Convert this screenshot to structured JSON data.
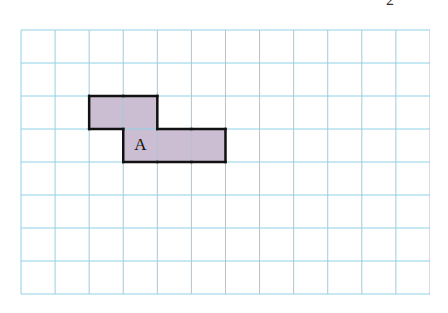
{
  "page": {
    "page_number_partial": "2"
  },
  "grid": {
    "columns": 12,
    "rows": 8,
    "cell_width": 34.08,
    "cell_height": 33,
    "line_color": "#8fd2e6",
    "background": "#ffffff"
  },
  "shape": {
    "label": "A",
    "fill_color": "#cbbdd2",
    "stroke_color": "#111111",
    "cells": [
      {
        "col": 2,
        "row": 2
      },
      {
        "col": 3,
        "row": 2
      },
      {
        "col": 3,
        "row": 3
      },
      {
        "col": 4,
        "row": 3
      },
      {
        "col": 5,
        "row": 3
      }
    ],
    "label_cell": {
      "col": 3,
      "row": 3
    }
  }
}
